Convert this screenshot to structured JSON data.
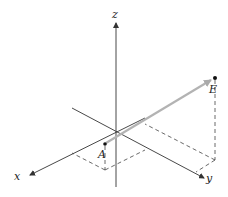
{
  "diagram": {
    "type": "3d-coordinate-axes-vector",
    "axes": {
      "x_label": "x",
      "y_label": "y",
      "z_label": "z"
    },
    "points": {
      "A": {
        "label": "A"
      },
      "E": {
        "label": "E"
      }
    },
    "vector": {
      "from": "A",
      "to": "E"
    },
    "colors": {
      "axis": "#333333",
      "vector": "#b0b0b0",
      "dashed": "#444444",
      "point": "#111111"
    }
  }
}
